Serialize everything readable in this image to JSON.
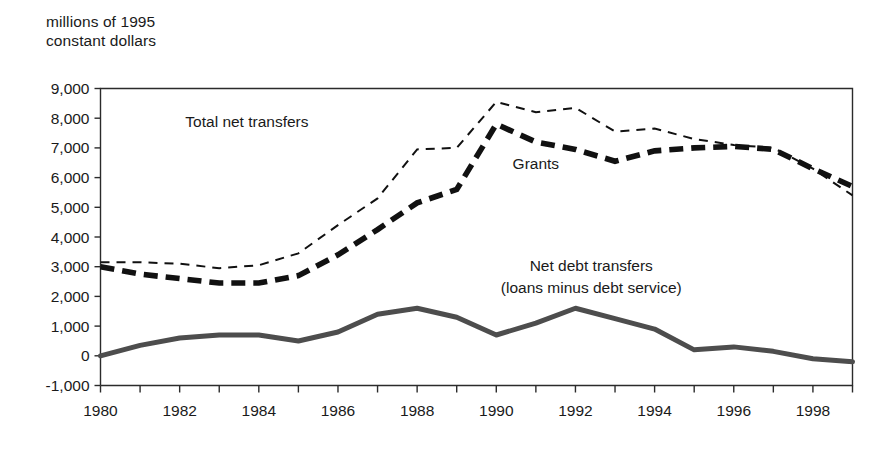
{
  "axis_title": "millions of 1995\nconstant dollars",
  "chart_data": {
    "type": "line",
    "title": "",
    "subtitle": "",
    "xlabel": "",
    "ylabel": "millions of 1995 constant dollars",
    "xlim": [
      1980,
      1999
    ],
    "ylim": [
      -1000,
      9000
    ],
    "grid": false,
    "legend_position": "inline-annotations",
    "ytick_labels": [
      "9,000",
      "8,000",
      "7,000",
      "6,000",
      "5,000",
      "4,000",
      "3,000",
      "2,000",
      "1,000",
      "0",
      "-1,000"
    ],
    "ytick_values": [
      9000,
      8000,
      7000,
      6000,
      5000,
      4000,
      3000,
      2000,
      1000,
      0,
      -1000
    ],
    "xtick_labels": [
      "1980",
      "1982",
      "1984",
      "1986",
      "1988",
      "1990",
      "1992",
      "1994",
      "1996",
      "1998"
    ],
    "xtick_values": [
      1980,
      1982,
      1984,
      1986,
      1988,
      1990,
      1992,
      1994,
      1996,
      1998
    ],
    "x": [
      1980,
      1981,
      1982,
      1983,
      1984,
      1985,
      1986,
      1987,
      1988,
      1989,
      1990,
      1991,
      1992,
      1993,
      1994,
      1995,
      1996,
      1997,
      1998,
      1999
    ],
    "series": [
      {
        "name": "Total net transfers",
        "style": "thin-dashed",
        "color": "#111111",
        "label": "Total net transfers",
        "label_x": 1983.7,
        "label_y": 7700,
        "values": [
          3150,
          3150,
          3100,
          2950,
          3050,
          3450,
          4400,
          5300,
          6950,
          7000,
          8550,
          8200,
          8350,
          7550,
          7650,
          7300,
          7100,
          7000,
          6300,
          5400
        ]
      },
      {
        "name": "Grants",
        "style": "thick-dashed",
        "color": "#111111",
        "label": "Grants",
        "label_x": 1991.0,
        "label_y": 6300,
        "values": [
          3000,
          2750,
          2600,
          2450,
          2450,
          2700,
          3400,
          4250,
          5150,
          5600,
          7800,
          7200,
          6950,
          6550,
          6900,
          7000,
          7050,
          6950,
          6300,
          5700
        ]
      },
      {
        "name": "Net debt transfers (loans minus debt service)",
        "style": "thick-solid",
        "color": "#4d4d4d",
        "label": "Net debt transfers",
        "label2": "(loans minus debt service)",
        "label_x": 1992.4,
        "label_y": 2850,
        "values": [
          0,
          350,
          600,
          700,
          700,
          500,
          800,
          1400,
          1600,
          1300,
          700,
          1100,
          1600,
          1250,
          900,
          200,
          300,
          150,
          -100,
          -200
        ]
      }
    ]
  }
}
